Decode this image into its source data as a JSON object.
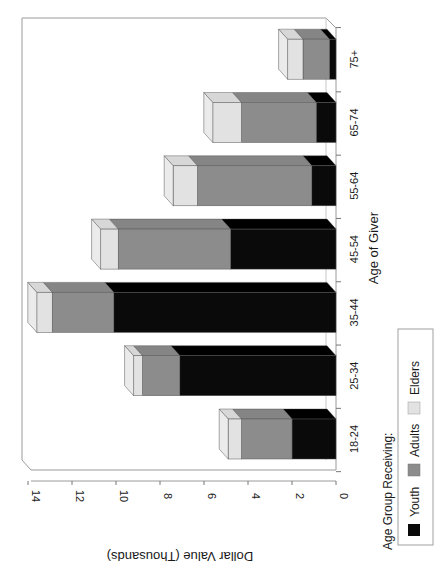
{
  "chart_data": {
    "type": "bar",
    "stacked": true,
    "three_d": true,
    "orientation": "rotated 90° counter-clockwise (vertical bars drawn sideways on page)",
    "title": "",
    "xlabel": "Age of Giver",
    "ylabel": "Dollar Value (Thousands)",
    "ylim": [
      0,
      14
    ],
    "yticks": [
      "0",
      "2",
      "4",
      "6",
      "8",
      "10",
      "12",
      "14"
    ],
    "categories": [
      "18-24",
      "25-34",
      "35-44",
      "45-54",
      "55-64",
      "65-74",
      "75+"
    ],
    "series": [
      {
        "name": "Youth",
        "color": "#0a0a0a",
        "values": [
          2.0,
          7.1,
          10.1,
          4.8,
          1.1,
          0.9,
          0.3
        ]
      },
      {
        "name": "Adults",
        "color": "#8c8c8c",
        "values": [
          2.3,
          1.7,
          2.8,
          5.1,
          5.2,
          3.4,
          1.2
        ]
      },
      {
        "name": "Elders",
        "color": "#e2e2e2",
        "values": [
          0.6,
          0.4,
          0.7,
          0.8,
          1.1,
          1.3,
          0.7
        ]
      }
    ],
    "totals": [
      4.9,
      9.2,
      13.6,
      10.7,
      7.4,
      5.6,
      2.2
    ],
    "legend": {
      "title": "Age Group Receiving:",
      "position": "bottom-right (rotated)",
      "entries": [
        "Youth",
        "Adults",
        "Elders"
      ]
    },
    "grid": false
  },
  "labels": {
    "xlabel": "Age of Giver",
    "ylabel": "Dollar Value (Thousands)",
    "legend_title": "Age Group Receiving:",
    "legend_youth": "Youth",
    "legend_adults": "Adults",
    "legend_elders": "Elders"
  },
  "colors": {
    "youth": "#0a0a0a",
    "adults": "#8c8c8c",
    "elders": "#e2e2e2",
    "frame": "#9a9a9a"
  }
}
